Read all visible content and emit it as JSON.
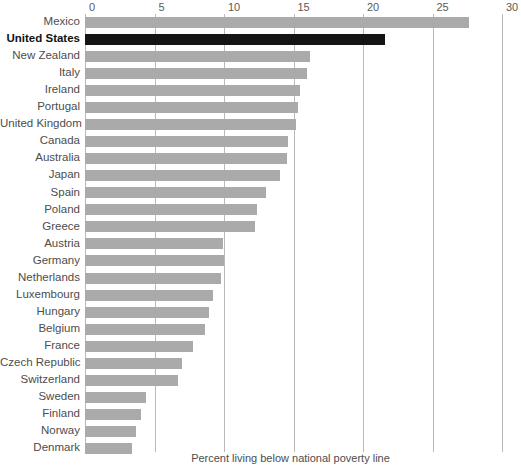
{
  "chart_data": {
    "type": "bar",
    "orientation": "horizontal",
    "title": "",
    "subtitle": "",
    "xlabel": "Percent living below national poverty line",
    "ylabel": "",
    "xlim": [
      0,
      30
    ],
    "xticks": [
      0,
      5,
      10,
      15,
      20,
      25,
      30
    ],
    "grid": true,
    "legend": false,
    "highlight_category": "United States",
    "colors": {
      "bar": "#aaaaaa",
      "highlight_bar": "#151515",
      "gridline": "#b9b9b9",
      "text": "#4d4d4d",
      "background": "#ffffff"
    },
    "categories": [
      "Mexico",
      "United States",
      "New Zealand",
      "Italy",
      "Ireland",
      "Portugal",
      "United Kingdom",
      "Canada",
      "Australia",
      "Japan",
      "Spain",
      "Poland",
      "Greece",
      "Austria",
      "Germany",
      "Netherlands",
      "Luxembourg",
      "Hungary",
      "Belgium",
      "France",
      "Czech Republic",
      "Switzerland",
      "Sweden",
      "Finland",
      "Norway",
      "Denmark"
    ],
    "values": [
      27.6,
      21.6,
      16.2,
      16.0,
      15.5,
      15.3,
      15.2,
      14.6,
      14.5,
      14.0,
      13.0,
      12.4,
      12.2,
      9.9,
      10.0,
      9.8,
      9.2,
      8.9,
      8.6,
      7.8,
      7.0,
      6.7,
      4.4,
      4.0,
      3.7,
      3.4
    ]
  },
  "caption": {
    "text": "Percent living below national poverty line"
  }
}
